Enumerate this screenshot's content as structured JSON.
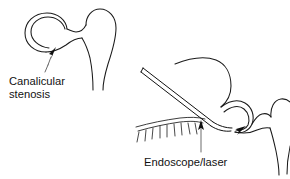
{
  "figure": {
    "type": "medical-line-illustration",
    "background_color": "#ffffff",
    "line_color": "#1a1a1a",
    "text_color": "#111111"
  },
  "panels": [
    {
      "id": "left-panel",
      "name": "canalicular-stenosis-panel",
      "label": {
        "line1": "Canalicular",
        "line2": "stenosis"
      },
      "parts": [
        {
          "name": "canaliculus-loop",
          "description": "circular canaliculus ring"
        },
        {
          "name": "lacrimal-sac",
          "description": "bulbous lacrimal sac"
        },
        {
          "name": "nasolacrimal-duct",
          "description": "tapering duct below sac"
        },
        {
          "name": "stenosis-arrow",
          "description": "arrow marking narrowed canaliculus"
        }
      ]
    },
    {
      "id": "right-panel",
      "name": "endoscope-laser-panel",
      "label": {
        "line1": "Endoscope/laser"
      },
      "parts": [
        {
          "name": "eyelid-margin",
          "description": "curved lid margin with lashes"
        },
        {
          "name": "eyelashes",
          "description": "row of lash strokes"
        },
        {
          "name": "endoscope-probe",
          "description": "thin instrument entering canaliculus"
        },
        {
          "name": "canaliculus-loop",
          "description": "canaliculus ring"
        },
        {
          "name": "lacrimal-sac",
          "description": "bulbous lacrimal sac"
        },
        {
          "name": "nasolacrimal-duct",
          "description": "tapering duct below sac"
        },
        {
          "name": "treatment-arrow",
          "description": "arrow showing laser direction into duct"
        }
      ]
    }
  ],
  "captions": {
    "canalicular_line1": "Canalicular",
    "canalicular_line2": "stenosis",
    "endoscope": "Endoscope/laser"
  }
}
